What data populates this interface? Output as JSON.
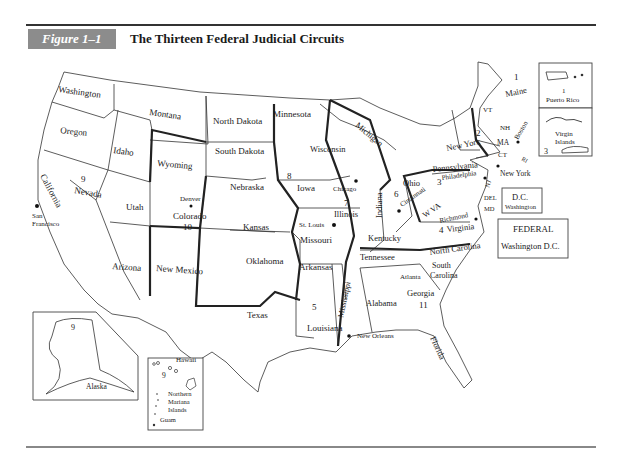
{
  "figure": {
    "label": "Figure 1–1",
    "title": "The Thirteen Federal Judicial Circuits"
  },
  "states": {
    "washington": "Washington",
    "oregon": "Oregon",
    "california": "California",
    "idaho": "Idaho",
    "nevada": "Nevada",
    "montana": "Montana",
    "wyoming": "Wyoming",
    "utah": "Utah",
    "colorado": "Colorado",
    "arizona": "Arizona",
    "new_mexico": "New Mexico",
    "north_dakota": "North Dakota",
    "south_dakota": "South Dakota",
    "nebraska": "Nebraska",
    "kansas": "Kansas",
    "oklahoma": "Oklahoma",
    "texas": "Texas",
    "minnesota": "Minnesota",
    "iowa": "Iowa",
    "missouri": "Missouri",
    "arkansas": "Arkansas",
    "louisiana": "Louisiana",
    "wisconsin": "Wisconsin",
    "illinois": "Illinois",
    "michigan": "Michigan",
    "indiana": "Indiana",
    "ohio": "Ohio",
    "kentucky": "Kentucky",
    "tennessee": "Tennessee",
    "mississippi": "Mississippi",
    "alabama": "Alabama",
    "georgia": "Georgia",
    "florida": "Florida",
    "south_carolina_1": "South",
    "south_carolina_2": "Carolina",
    "north_carolina": "North Carolina",
    "virginia": "Virginia",
    "west_virginia": "W VA",
    "pennsylvania": "Pennsylvania",
    "new_york": "New York",
    "vermont": "VT",
    "new_hampshire": "NH",
    "maine": "Maine",
    "massachusetts": "MA",
    "connecticut": "CT",
    "rhode_island": "RI",
    "new_jersey": "NJ",
    "delaware": "DEL",
    "maryland": "MD",
    "alaska": "Alaska"
  },
  "cities": {
    "san_francisco_1": "San",
    "san_francisco_2": "Francisco",
    "denver": "Denver",
    "st_louis": "St. Louis",
    "chicago": "Chicago",
    "cincinnati": "Cincinnati",
    "philadelphia": "Philadelphia",
    "new_york_city": "New York",
    "boston": "Boston",
    "richmond": "Richmond",
    "atlanta": "Atlanta",
    "new_orleans": "New Orleans"
  },
  "circuits": {
    "c1": "1",
    "c2": "2",
    "c3": "3",
    "c4": "4",
    "c5": "5",
    "c6": "6",
    "c7": "7",
    "c8": "8",
    "c9": "9",
    "c10": "10",
    "c11": "11"
  },
  "insets": {
    "puerto_rico": {
      "circuit": "1",
      "label": "Puerto Rico"
    },
    "virgin_islands": {
      "label_1": "Virgin",
      "label_2": "Islands",
      "circuit": "3"
    },
    "dc": {
      "title": "D.C.",
      "city": "Washington"
    },
    "federal": {
      "title": "FEDERAL",
      "city": "Washington D.C."
    },
    "alaska": {
      "circuit": "9",
      "label": "Alaska"
    },
    "pacific": {
      "hawaii": "Hawaii",
      "circuit": "9",
      "nmi_1": "Northern",
      "nmi_2": "Mariana",
      "nmi_3": "Islands",
      "guam": "Guam"
    }
  }
}
